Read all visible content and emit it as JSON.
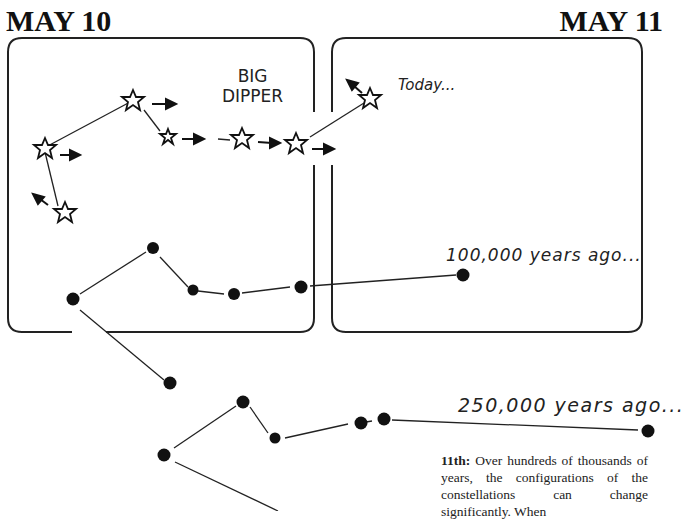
{
  "headings": {
    "left": "MAY 10",
    "right": "MAY 11"
  },
  "constellation_label": {
    "line1": "BIG",
    "line2": "DIPPER"
  },
  "epochs": [
    {
      "label": "Today...",
      "marker": "star-outline"
    },
    {
      "label": "100,000 years ago...",
      "marker": "filled-dot"
    },
    {
      "label": "250,000 years ago...",
      "marker": "filled-dot"
    }
  ],
  "caption": {
    "lead": "11th:",
    "text": " Over hundreds of thousands of years, the configurations of the constellations can change significantly. When"
  },
  "colors": {
    "ink": "#111111",
    "background": "#ffffff"
  }
}
